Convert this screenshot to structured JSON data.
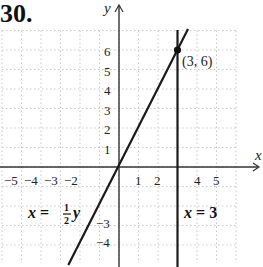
{
  "problem_number": "30.",
  "axes": {
    "x_label": "x",
    "y_label": "y",
    "x_ticks": [
      {
        "value": -5,
        "label": "−5"
      },
      {
        "value": -4,
        "label": "−4"
      },
      {
        "value": -3,
        "label": "−3"
      },
      {
        "value": -2,
        "label": "−2"
      },
      {
        "value": 1,
        "label": "1"
      },
      {
        "value": 2,
        "label": "2"
      },
      {
        "value": 4,
        "label": "4"
      },
      {
        "value": 5,
        "label": "5"
      }
    ],
    "y_ticks": [
      {
        "value": 6,
        "label": "6"
      },
      {
        "value": 5,
        "label": "5"
      },
      {
        "value": 4,
        "label": "4"
      },
      {
        "value": 3,
        "label": "3"
      },
      {
        "value": 2,
        "label": "2"
      },
      {
        "value": 1,
        "label": "1"
      },
      {
        "value": -3,
        "label": "−3"
      },
      {
        "value": -4,
        "label": "−4"
      }
    ]
  },
  "point": {
    "label": "(3, 6)",
    "x": 3,
    "y": 6
  },
  "equations": {
    "slanted": {
      "lhs": "x",
      "eq": "=",
      "num": "1",
      "den": "2",
      "var": "y"
    },
    "vertical": {
      "lhs": "x",
      "eq": "=",
      "rhs": "3"
    }
  },
  "colors": {
    "line": "#1a1a1a",
    "grid": "#c8c8c8",
    "axis": "#333333"
  },
  "chart_data": {
    "type": "line",
    "title": "30.",
    "xlabel": "x",
    "ylabel": "y",
    "xlim": [
      -6,
      6
    ],
    "ylim": [
      -5,
      7
    ],
    "grid": true,
    "x_tick_labels": [
      "-5",
      "-4",
      "-3",
      "-2",
      "1",
      "2",
      "4",
      "5"
    ],
    "y_tick_labels": [
      "6",
      "5",
      "4",
      "3",
      "2",
      "1",
      "-3",
      "-4"
    ],
    "series": [
      {
        "name": "x = (1/2)y",
        "x": [
          -2.5,
          3.5
        ],
        "y": [
          -5,
          7
        ]
      },
      {
        "name": "x = 3",
        "x": [
          3,
          3
        ],
        "y": [
          -5,
          7
        ]
      }
    ],
    "annotations": [
      {
        "text": "(3, 6)",
        "x": 3,
        "y": 6,
        "marker": "point"
      },
      {
        "text": "x = ½y",
        "x": -4.5,
        "y": -2.5
      },
      {
        "text": "x = 3",
        "x": 3.3,
        "y": -2.5
      }
    ]
  }
}
